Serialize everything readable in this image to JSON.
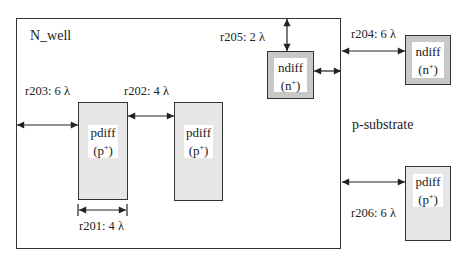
{
  "regions": {
    "nwell_label": "N_well",
    "substrate_label": "p-substrate"
  },
  "shapes": {
    "pdiff_1": {
      "name": "pdiff",
      "type": "(p",
      "sup": "+",
      "close": ")"
    },
    "pdiff_2": {
      "name": "pdiff",
      "type": "(p",
      "sup": "+",
      "close": ")"
    },
    "ndiff_in": {
      "name": "ndiff",
      "type": "(n",
      "sup": "+",
      "close": ")"
    },
    "ndiff_out": {
      "name": "ndiff",
      "type": "(n",
      "sup": "+",
      "close": ")"
    },
    "pdiff_out": {
      "name": "pdiff",
      "type": "(p",
      "sup": "+",
      "close": ")"
    }
  },
  "rules": {
    "r201": "r201: 4 λ",
    "r202": "r202: 4 λ",
    "r203": "r203: 6 λ",
    "r204": "r204: 6 λ",
    "r205": "r205: 2 λ",
    "r206": "r206: 6 λ"
  },
  "colors": {
    "pdiff_fill": "#e6e6e6",
    "ndiff_fill": "#c8c8c8",
    "outline": "#333333"
  }
}
